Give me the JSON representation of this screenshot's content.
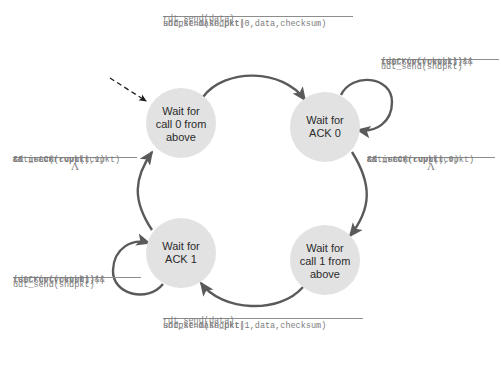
{
  "diagram": {
    "colors": {
      "state_fill": "#e2e2e2",
      "arc": "#5a5a5a",
      "text": "#2b2b2b",
      "code_text": "#7d7d7d",
      "rule": "#8d8d8d",
      "background": "#ffffff"
    },
    "states": [
      {
        "id": "wait-call-0",
        "line1": "Wait for",
        "line2": "call 0 from",
        "line3": "above",
        "cx": 181,
        "cy": 123,
        "r": 35
      },
      {
        "id": "wait-ack-0",
        "line1": "Wait for",
        "line2": "ACK 0",
        "line3": "",
        "cx": 325,
        "cy": 127,
        "r": 35
      },
      {
        "id": "wait-call-1",
        "line1": "Wait for",
        "line2": "call 1 from",
        "line3": "above",
        "cx": 325,
        "cy": 260,
        "r": 35
      },
      {
        "id": "wait-ack-1",
        "line1": "Wait for",
        "line2": "ACK 1",
        "line3": "",
        "cx": 181,
        "cy": 253,
        "r": 35
      }
    ],
    "labels": {
      "top_transition": {
        "condition": "rdt_send(data)",
        "actions": [
          "sndpkt=make_pkt(0,data,checksum)",
          "udt_send(sndpkt)"
        ]
      },
      "bottom_transition": {
        "condition": "rdt_send(data)",
        "actions": [
          "sndpkt=make_pkt(1,data,checksum)",
          "udt_send(sndpkt)"
        ]
      },
      "top_right_selfloop": {
        "condition": [
          "rdt_rcv(rcvpkt) &&",
          "(corrupt(rcvpkt)||",
          "isACK(rcvpkt,1))"
        ],
        "actions": [
          "udt_send(sndpkt)"
        ]
      },
      "bottom_left_selfloop": {
        "condition": [
          "rdt_rcv(rcvpkt) &&",
          "(corrupt(rcvpkt)||",
          "isACK(rcvpkt,0))"
        ],
        "actions": [
          "udt_send(sndpkt)"
        ]
      },
      "left_transition": {
        "condition": [
          "rdt_rcv(rcvpkt)",
          "&& notcorrupt(rcvpkt)",
          "&& isACK(rcvpkt,1)"
        ],
        "action": "Λ"
      },
      "right_transition": {
        "condition": [
          "rdt_rcv(rcvpkt)",
          "&& notcorrupt(rcvpkt)",
          "&& isACK(rcvpkt,0)"
        ],
        "action": "Λ"
      }
    }
  }
}
